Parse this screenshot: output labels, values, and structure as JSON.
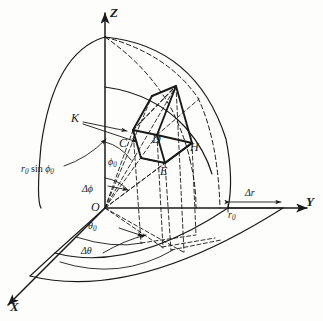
{
  "figure": {
    "background_color": "#fdfdfc",
    "ink_color": "#1a1a1a",
    "axes": [
      {
        "name": "z-axis",
        "label": "Z"
      },
      {
        "name": "y-axis",
        "label": "Y"
      },
      {
        "name": "x-axis",
        "label": "X"
      }
    ],
    "points": [
      {
        "name": "origin",
        "label": "O"
      },
      {
        "name": "point-k",
        "label": "K"
      },
      {
        "name": "point-c",
        "label": "C"
      },
      {
        "name": "point-d",
        "label": "D"
      },
      {
        "name": "point-e",
        "label": "E"
      },
      {
        "name": "point-h",
        "label": "H"
      }
    ],
    "angle_labels": [
      {
        "name": "phi-zero",
        "symbol": "ϕ",
        "subscript": "0"
      },
      {
        "name": "delta-phi",
        "symbol": "Δϕ"
      },
      {
        "name": "theta-zero",
        "symbol": "θ",
        "subscript": "0"
      },
      {
        "name": "delta-theta",
        "symbol": "Δθ"
      }
    ],
    "length_labels": [
      {
        "name": "r0-sin-phi0",
        "text": "r0 sin ϕ0"
      },
      {
        "name": "r-zero",
        "symbol": "r",
        "subscript": "0"
      },
      {
        "name": "delta-r",
        "symbol": "Δr"
      }
    ],
    "axis_z_label": "Z",
    "axis_y_label": "Y",
    "axis_x_label": "X",
    "label_o": "O",
    "label_k": "K",
    "label_c": "C",
    "label_d": "D",
    "label_e": "E",
    "label_h": "H",
    "label_phi0_sym": "ϕ",
    "label_phi0_sub": "0",
    "label_dphi": "Δϕ",
    "label_theta0_sym": "θ",
    "label_theta0_sub": "0",
    "label_dtheta": "Δθ",
    "label_r0sinphi0_r": "r",
    "label_r0sinphi0_sub1": "0",
    "label_r0sinphi0_sin": "sin",
    "label_r0sinphi0_phi": "ϕ",
    "label_r0sinphi0_sub2": "0",
    "label_r0_sym": "r",
    "label_r0_sub": "0",
    "label_dr": "Δr"
  }
}
